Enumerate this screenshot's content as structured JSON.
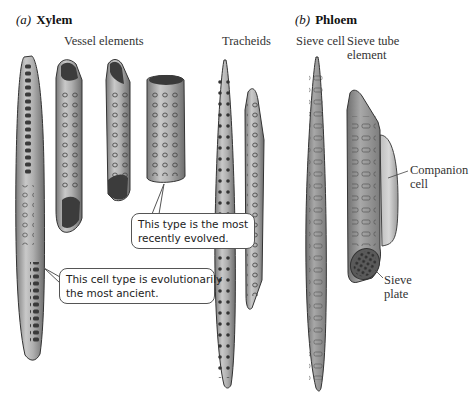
{
  "panels": {
    "xylem": {
      "letter": "(a)",
      "name": "Xylem"
    },
    "phloem": {
      "letter": "(b)",
      "name": "Phloem"
    }
  },
  "column_labels": {
    "vessel_elements": "Vessel elements",
    "tracheids": "Tracheids",
    "sieve_cell": "Sieve cell",
    "sieve_tube_element_line1": "Sieve tube",
    "sieve_tube_element_line2": "element"
  },
  "side_labels": {
    "companion_cell_line1": "Companion",
    "companion_cell_line2": "cell",
    "sieve_plate_line1": "Sieve",
    "sieve_plate_line2": "plate"
  },
  "callouts": {
    "recent": {
      "line1": "This type is the most",
      "line2": "recently evolved."
    },
    "ancient": {
      "line1": "This cell type is evolutionarily",
      "line2": "the most ancient."
    }
  },
  "colors": {
    "cell_fill": "#a9a9a9",
    "cell_dark": "#6e6e6e",
    "cell_light": "#cfcfcf",
    "outline": "#3a3a3a"
  }
}
